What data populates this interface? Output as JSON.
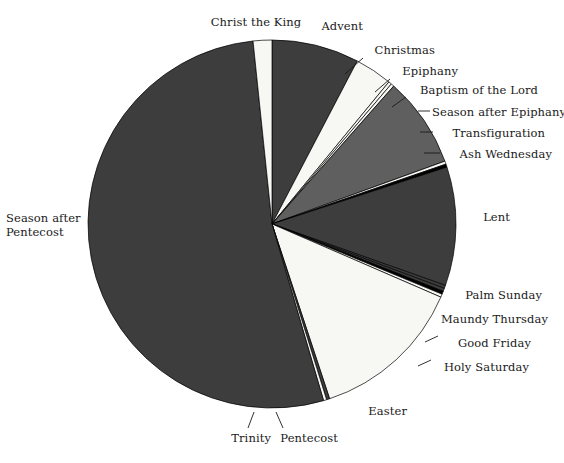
{
  "figure": {
    "background_color": "#ffffff",
    "center_x": 272,
    "center_y": 224,
    "radius": 184
  },
  "palette": {
    "dark_gray": "#3d3d3d",
    "mid_gray": "#5f5f5f",
    "black": "#000000",
    "white": "#f7f7f4",
    "outline": "#000000",
    "text": "#1a1a1a"
  },
  "chart_data": {
    "type": "pie",
    "title": "",
    "start_angle_deg": 0,
    "direction": "clockwise",
    "units": "days",
    "total": 365,
    "legend": "none (direct labels with leader lines)",
    "categories": [
      "Advent",
      "Christmas",
      "Epiphany",
      "Baptism of the Lord",
      "Season after Epiphany",
      "Transfiguration",
      "Ash Wednesday",
      "Lent",
      "Palm Sunday",
      "Maundy Thursday",
      "Good Friday",
      "Holy Saturday",
      "Easter",
      "Pentecost",
      "Trinity",
      "Season after Pentecost",
      "Christ the King"
    ],
    "values": [
      28,
      12,
      1,
      1,
      29,
      1,
      1,
      38,
      1,
      1,
      1,
      1,
      49,
      1,
      1,
      193,
      6
    ],
    "colors": [
      "#3d3d3d",
      "#f7f7f4",
      "#f7f7f4",
      "#f7f7f4",
      "#5f5f5f",
      "#f7f7f4",
      "#000000",
      "#3d3d3d",
      "#3d3d3d",
      "#3d3d3d",
      "#000000",
      "#f7f7f4",
      "#f7f7f4",
      "#3d3d3d",
      "#f7f7f4",
      "#3d3d3d",
      "#f7f7f4"
    ]
  },
  "labels": [
    {
      "id": "christ-the-king",
      "text": "Christ the King",
      "x": 206,
      "y": 16,
      "align": "center",
      "w": 100,
      "leader": null
    },
    {
      "id": "advent",
      "text": "Advent",
      "x": 303,
      "y": 20,
      "align": "left",
      "w": 60,
      "leader": null
    },
    {
      "id": "christmas",
      "text": "Christmas",
      "x": 365,
      "y": 44,
      "align": "left",
      "w": 70,
      "leader": {
        "x1": 363,
        "y1": 58,
        "x2": 345,
        "y2": 74
      }
    },
    {
      "id": "epiphany",
      "text": "Epiphany",
      "x": 392,
      "y": 65,
      "align": "left",
      "w": 66,
      "leader": {
        "x1": 390,
        "y1": 79,
        "x2": 375,
        "y2": 92
      }
    },
    {
      "id": "baptism-of-the-lord",
      "text": "Baptism of the Lord",
      "x": 408,
      "y": 84,
      "align": "left",
      "w": 130,
      "leader": {
        "x1": 406,
        "y1": 97,
        "x2": 392,
        "y2": 107
      }
    },
    {
      "id": "season-after-epiphany",
      "text": "Season after Epiphany",
      "x": 432,
      "y": 106,
      "align": "left",
      "w": 132,
      "leader": {
        "x1": 418,
        "y1": 111,
        "x2": 430,
        "y2": 111
      }
    },
    {
      "id": "transfiguration",
      "text": "Transfiguration",
      "x": 435,
      "y": 127,
      "align": "left",
      "w": 110,
      "leader": {
        "x1": 420,
        "y1": 132,
        "x2": 433,
        "y2": 132
      }
    },
    {
      "id": "ash-wednesday",
      "text": "Ash Wednesday",
      "x": 442,
      "y": 148,
      "align": "left",
      "w": 110,
      "leader": {
        "x1": 424,
        "y1": 153,
        "x2": 440,
        "y2": 153
      }
    },
    {
      "id": "lent",
      "text": "Lent",
      "x": 470,
      "y": 211,
      "align": "left",
      "w": 40,
      "leader": null
    },
    {
      "id": "palm-sunday",
      "text": "Palm Sunday",
      "x": 452,
      "y": 289,
      "align": "left",
      "w": 90,
      "leader": null
    },
    {
      "id": "maundy-thursday",
      "text": "Maundy Thursday",
      "x": 438,
      "y": 313,
      "align": "left",
      "w": 110,
      "leader": null
    },
    {
      "id": "good-friday",
      "text": "Good Friday",
      "x": 441,
      "y": 337,
      "align": "left",
      "w": 90,
      "leader": {
        "x1": 425,
        "y1": 342,
        "x2": 438,
        "y2": 336
      }
    },
    {
      "id": "holy-saturday",
      "text": "Holy Saturday",
      "x": 434,
      "y": 361,
      "align": "left",
      "w": 95,
      "leader": {
        "x1": 418,
        "y1": 366,
        "x2": 431,
        "y2": 360
      }
    },
    {
      "id": "easter",
      "text": "Easter",
      "x": 352,
      "y": 405,
      "align": "left",
      "w": 55,
      "leader": null
    },
    {
      "id": "pentecost",
      "text": "Pentecost",
      "x": 268,
      "y": 432,
      "align": "left",
      "w": 70,
      "leader": {
        "x1": 283,
        "y1": 428,
        "x2": 276,
        "y2": 412
      }
    },
    {
      "id": "trinity",
      "text": "Trinity",
      "x": 216,
      "y": 432,
      "align": "left",
      "w": 55,
      "leader": {
        "x1": 248,
        "y1": 428,
        "x2": 254,
        "y2": 412
      }
    },
    {
      "id": "season-after-pentecost",
      "text": "Season after\nPentecost",
      "x": 6,
      "y": 212,
      "align": "right",
      "w": 90,
      "leader": null
    }
  ]
}
